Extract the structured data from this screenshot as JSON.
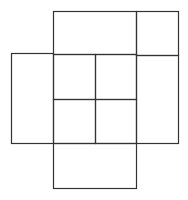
{
  "diagram": {
    "title": "",
    "stroke_color": "#333333",
    "background": "#ffffff",
    "shapes": [
      {
        "id": "top-wide",
        "x": 53,
        "y": 11,
        "w": 83,
        "h": 43
      },
      {
        "id": "top-right",
        "x": 136,
        "y": 11,
        "w": 42,
        "h": 44
      },
      {
        "id": "left-tall",
        "x": 11,
        "y": 53,
        "w": 42,
        "h": 90
      },
      {
        "id": "center-top-left",
        "x": 53,
        "y": 54,
        "w": 42,
        "h": 45
      },
      {
        "id": "center-top-right",
        "x": 95,
        "y": 54,
        "w": 41,
        "h": 45
      },
      {
        "id": "center-bottom-left",
        "x": 53,
        "y": 99,
        "w": 42,
        "h": 44
      },
      {
        "id": "center-bottom-right",
        "x": 95,
        "y": 99,
        "w": 41,
        "h": 44
      },
      {
        "id": "right-tall",
        "x": 136,
        "y": 55,
        "w": 42,
        "h": 88
      },
      {
        "id": "bottom-wide",
        "x": 53,
        "y": 143,
        "w": 83,
        "h": 45
      }
    ]
  }
}
